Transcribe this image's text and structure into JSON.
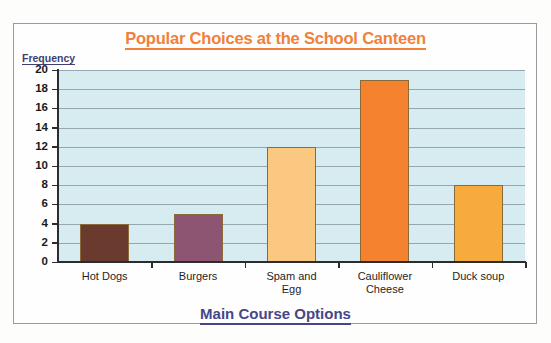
{
  "chart_data": {
    "type": "bar",
    "title": "Popular Choices at the School Canteen",
    "xlabel": "Main Course Options",
    "ylabel": "Frequency",
    "categories": [
      "Hot Dogs",
      "Burgers",
      "Spam and Egg",
      "Cauliflower Cheese",
      "Duck soup"
    ],
    "values": [
      4,
      5,
      12,
      19,
      8
    ],
    "ylim": [
      0,
      20
    ],
    "ytick_step": 2,
    "ytick_labels": [
      "20",
      "18",
      "16",
      "14",
      "12",
      "10",
      "8",
      "6",
      "4",
      "2",
      "0"
    ],
    "grid": true,
    "legend": "none",
    "bar_colors": [
      "#6b3a2e",
      "#8e5573",
      "#fac880",
      "#f4822e",
      "#f6ab3c"
    ],
    "plot_background": "#d6ecf1",
    "gridline_color": "#8d9aa4",
    "title_color": "#f0803a",
    "axis_label_color": "#46468a",
    "ylabel_color": "#3f3f70"
  },
  "chart": {
    "title": "Popular Choices at the School Canteen",
    "ylabel": "Frequency",
    "xlabel": "Main Course Options",
    "categories": [
      {
        "line1": "Hot Dogs",
        "line2": ""
      },
      {
        "line1": "Burgers",
        "line2": ""
      },
      {
        "line1": "Spam and",
        "line2": "Egg"
      },
      {
        "line1": "Cauliflower",
        "line2": "Cheese"
      },
      {
        "line1": "Duck soup",
        "line2": ""
      }
    ]
  }
}
